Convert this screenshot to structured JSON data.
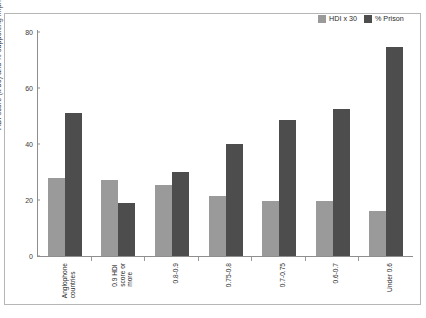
{
  "chart_data": {
    "type": "bar",
    "title": "",
    "subtitle": "",
    "xlabel": "",
    "ylabel": "HDI score (x 30) and % supporting imprisonment",
    "ylim": [
      0,
      80
    ],
    "yticks": [
      0,
      20,
      40,
      60,
      80
    ],
    "grid": false,
    "legend_position": "top-right",
    "categories": [
      "Anglophone countries",
      "0.9 HDI score or more",
      "0.8-0.9",
      "0.75-0.8",
      "0.7-0.75",
      "0.6-0.7",
      "Under 0.6"
    ],
    "category_lines": [
      [
        "Anglophone",
        "countries"
      ],
      [
        "0.9 HDI",
        "score or",
        "more"
      ],
      [
        "0.8-0.9"
      ],
      [
        "0.75-0.8"
      ],
      [
        "0.7-0.75"
      ],
      [
        "0.6-0.7"
      ],
      [
        "Under 0.6"
      ]
    ],
    "series": [
      {
        "name": "HDI x 30",
        "color": "#9a9a9a",
        "values": [
          28,
          27,
          25.5,
          21.5,
          19.5,
          19.5,
          16
        ]
      },
      {
        "name": "% Prison",
        "color": "#4d4d4d",
        "values": [
          51,
          19,
          30,
          40,
          48.5,
          52.5,
          74.5
        ]
      }
    ]
  },
  "legend": {
    "items": [
      {
        "label": "HDI x 30",
        "color": "#9a9a9a"
      },
      {
        "label": "% Prison",
        "color": "#4d4d4d"
      }
    ]
  },
  "axis": {
    "y_title": "HDI score (x 30) and % supporting imprisonment",
    "y_tick_labels": [
      "80",
      "60",
      "40",
      "20",
      "0"
    ]
  }
}
